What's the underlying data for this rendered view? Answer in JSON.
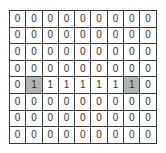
{
  "grid": {
    "rows": 8,
    "cols": 9,
    "highlight_color": "#b4b4b4",
    "cells": [
      [
        "0",
        "0",
        "0",
        "0",
        "0",
        "0",
        "0",
        "0",
        "0"
      ],
      [
        "0",
        "0",
        "0",
        "0",
        "0",
        "0",
        "0",
        "0",
        "0"
      ],
      [
        "0",
        "0",
        "0",
        "0",
        "0",
        "0",
        "0",
        "0",
        "0"
      ],
      [
        "0",
        "0",
        "0",
        "0",
        "0",
        "0",
        "0",
        "0",
        "0"
      ],
      [
        "0",
        "1",
        "1",
        "1",
        "1",
        "1",
        "1",
        "1",
        "0"
      ],
      [
        "0",
        "0",
        "0",
        "0",
        "0",
        "0",
        "0",
        "0",
        "0"
      ],
      [
        "0",
        "0",
        "0",
        "0",
        "0",
        "0",
        "0",
        "0",
        "0"
      ],
      [
        "0",
        "0",
        "0",
        "0",
        "0",
        "0",
        "0",
        "0",
        "0"
      ]
    ],
    "highlighted": [
      [
        4,
        1
      ],
      [
        4,
        7
      ]
    ]
  }
}
